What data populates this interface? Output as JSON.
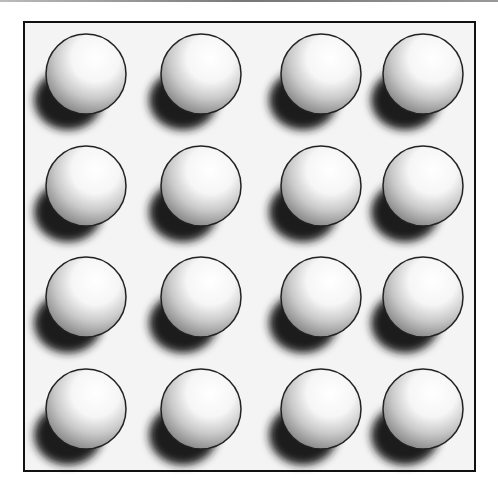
{
  "figure": {
    "rows": 4,
    "cols": 4,
    "sphere_radius": 40,
    "col_centers_x": [
      86,
      201,
      321,
      423
    ],
    "row_centers_y": [
      74,
      186,
      297,
      409
    ],
    "colors": {
      "frame": "#111111",
      "background": "#f4f4f4",
      "sphere_outline": "#222222",
      "shadow": "#1e1e1e"
    }
  }
}
